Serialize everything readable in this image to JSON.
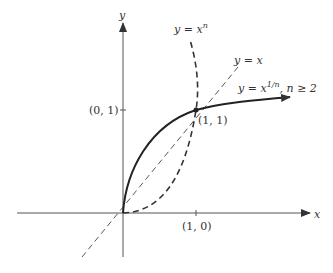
{
  "diagram": {
    "axes": {
      "x_label": "x",
      "y_label": "y"
    },
    "ticks": {
      "y_tick_label": "(0, 1)",
      "x_tick_label": "(1, 0)"
    },
    "points": {
      "intersection_label": "(1, 1)"
    },
    "curves": {
      "power_label_base": "y = x",
      "power_label_exp": "n",
      "identity_label": "y = x",
      "root_label_base": "y = x",
      "root_label_exp": "1/n",
      "root_condition": ", n ≥ 2"
    },
    "colors": {
      "ink": "#333333",
      "background": "#ffffff"
    }
  }
}
